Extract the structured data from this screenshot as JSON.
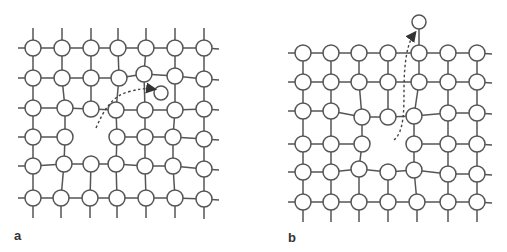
{
  "figure": {
    "style": {
      "line_color": "#555555",
      "node_fill": "#ffffff",
      "node_stroke": "#555555",
      "arrow_color": "#444444"
    },
    "node_radius": 8,
    "panels": [
      {
        "id": "a",
        "label": "a",
        "label_pos": [
          14,
          240
        ],
        "description": "Crystal lattice with vacancy; atom moves from lattice into interstitial site",
        "rows": [
          [
            [
              33,
              48
            ],
            [
              62,
              48
            ],
            [
              91,
              48
            ],
            [
              118,
              48
            ],
            [
              146,
              48
            ],
            [
              175,
              48
            ],
            [
              204,
              48
            ]
          ],
          [
            [
              33,
              78
            ],
            [
              62,
              78
            ],
            [
              91,
              78
            ],
            [
              119,
              78
            ],
            [
              144,
              74
            ],
            [
              175,
              76
            ],
            [
              204,
              79
            ]
          ],
          [
            [
              33,
              108
            ],
            [
              65,
              108
            ],
            [
              91,
              109
            ],
            [
              116,
              110
            ],
            [
              145,
              110
            ],
            [
              175,
              110
            ],
            [
              204,
              109
            ]
          ],
          [
            [
              33,
              137
            ],
            [
              65,
              137
            ],
            null,
            [
              117,
              137
            ],
            [
              145,
              137
            ],
            [
              173,
              137
            ],
            [
              204,
              139
            ]
          ],
          [
            [
              33,
              166
            ],
            [
              64,
              164
            ],
            [
              91,
              164
            ],
            [
              116,
              164
            ],
            [
              145,
              166
            ],
            [
              173,
              166
            ],
            [
              204,
              169
            ]
          ],
          [
            [
              33,
              198
            ],
            [
              61,
              198
            ],
            [
              90,
              198
            ],
            [
              117,
              198
            ],
            [
              146,
              198
            ],
            [
              175,
              198
            ],
            [
              204,
              199
            ]
          ]
        ],
        "extra_nodes": [
          [
            161,
            93
          ]
        ],
        "arrow": {
          "path": "M96,128 C104,110 112,96 128,92 C138,89 146,88 153,89",
          "head": [
            156,
            89
          ]
        }
      },
      {
        "id": "b",
        "label": "b",
        "label_pos": [
          288,
          242
        ],
        "description": "Crystal lattice with vacancy; atom migrates to the surface",
        "rows": [
          [
            [
              303,
              53
            ],
            [
              331,
              53
            ],
            [
              359,
              53
            ],
            [
              388,
              53
            ],
            [
              419,
              53
            ],
            [
              448,
              53
            ],
            [
              477,
              53
            ]
          ],
          [
            [
              303,
              82
            ],
            [
              331,
              82
            ],
            [
              359,
              82
            ],
            [
              388,
              82
            ],
            [
              419,
              82
            ],
            [
              448,
              82
            ],
            [
              477,
              82
            ]
          ],
          [
            [
              303,
              111
            ],
            [
              331,
              111
            ],
            [
              362,
              117
            ],
            [
              388,
              117
            ],
            [
              414,
              116
            ],
            [
              448,
              113
            ],
            [
              477,
              113
            ]
          ],
          [
            [
              303,
              144
            ],
            [
              331,
              144
            ],
            [
              362,
              144
            ],
            null,
            [
              414,
              144
            ],
            [
              448,
              144
            ],
            [
              477,
              144
            ]
          ],
          [
            [
              303,
              172
            ],
            [
              331,
              172
            ],
            [
              359,
              169
            ],
            [
              388,
              172
            ],
            [
              414,
              170
            ],
            [
              448,
              174
            ],
            [
              477,
              174
            ]
          ],
          [
            [
              303,
              202
            ],
            [
              331,
              202
            ],
            [
              359,
              202
            ],
            [
              388,
              202
            ],
            [
              417,
              202
            ],
            [
              448,
              202
            ],
            [
              477,
              202
            ]
          ]
        ],
        "extra_nodes": [
          [
            419,
            22
          ]
        ],
        "extra_edges": [
          [
            [
              419,
              22
            ],
            [
              419,
              53
            ]
          ]
        ],
        "arrow": {
          "path": "M394,140 C404,132 404,110 404,90 C404,60 408,42 414,34",
          "head": [
            416,
            30
          ]
        }
      }
    ]
  }
}
